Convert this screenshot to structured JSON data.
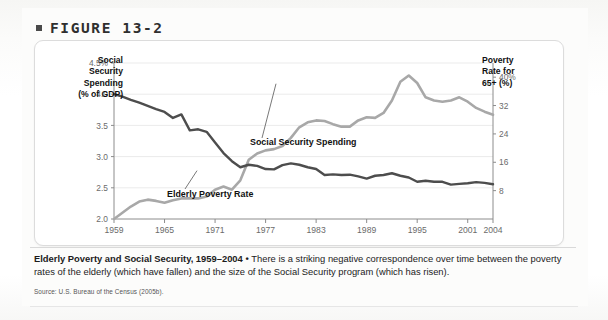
{
  "figure": {
    "bullet": "■",
    "label": "FIGURE 13-2"
  },
  "axis": {
    "left_title": "Social Security Spending (% of GDP)",
    "left_title_lines": [
      "Social",
      "Security",
      "Spending",
      "(% of GDP)"
    ],
    "right_title_lines": [
      "Poverty",
      "Rate for",
      "65+ (%)"
    ]
  },
  "caption": {
    "bold": "Elderly Poverty and Social Security, 1959–2004",
    "separator": " • ",
    "body": "There is a striking negative correspondence over time between the poverty rates of the elderly (which have fallen) and the size of the Social Security program (which has risen)."
  },
  "source": "Source: U.S. Bureau of the Census (2005b).",
  "colors": {
    "spending_line": "#a8a8a8",
    "poverty_line": "#4d4d4d",
    "grid": "#ebebeb",
    "axis": "#8c8c8c",
    "text": "#1b1b1b",
    "tick_text": "#6b6b6b",
    "card_bg": "#ffffff",
    "page_bg": "#fcfcfb"
  },
  "chart_data": {
    "type": "line",
    "xlabel": "",
    "grid": true,
    "legend": "inline-callout",
    "x_ticks": [
      1959,
      1965,
      1971,
      1977,
      1983,
      1989,
      1995,
      2001,
      2004
    ],
    "x_tick_labels": [
      "1959",
      "1965",
      "1971",
      "1977",
      "1983",
      "1989",
      "1995",
      "2001",
      "2004"
    ],
    "xlim": [
      1959,
      2004
    ],
    "left_axis": {
      "label": "Social Security Spending (% of GDP)",
      "ticks": [
        2.0,
        2.5,
        3.0,
        3.5,
        4.0,
        4.5
      ],
      "tick_labels": [
        "2.0",
        "2.5",
        "3.0",
        "3.5",
        "4.0",
        "4.5%"
      ],
      "ylim": [
        2.0,
        4.5
      ]
    },
    "right_axis": {
      "label": "Poverty Rate for 65+ (%)",
      "ticks": [
        8,
        16,
        24,
        32,
        40
      ],
      "tick_labels": [
        "8",
        "16",
        "24",
        "32",
        "40%"
      ],
      "ylim": [
        0,
        44
      ]
    },
    "series": [
      {
        "name": "Social Security Spending",
        "axis": "left",
        "color": "#a8a8a8",
        "label_text": "Social Security Spending",
        "x": [
          1959,
          1960,
          1961,
          1962,
          1963,
          1964,
          1965,
          1966,
          1967,
          1968,
          1969,
          1970,
          1971,
          1972,
          1973,
          1974,
          1975,
          1976,
          1977,
          1978,
          1979,
          1980,
          1981,
          1982,
          1983,
          1984,
          1985,
          1986,
          1987,
          1988,
          1989,
          1990,
          1991,
          1992,
          1993,
          1994,
          1995,
          1996,
          1997,
          1998,
          1999,
          2000,
          2001,
          2002,
          2003,
          2004
        ],
        "values": [
          2.0,
          2.1,
          2.2,
          2.28,
          2.31,
          2.29,
          2.26,
          2.3,
          2.33,
          2.33,
          2.33,
          2.36,
          2.47,
          2.52,
          2.47,
          2.62,
          2.95,
          3.05,
          3.1,
          3.12,
          3.17,
          3.3,
          3.47,
          3.55,
          3.58,
          3.57,
          3.52,
          3.48,
          3.48,
          3.58,
          3.63,
          3.62,
          3.7,
          3.9,
          4.2,
          4.3,
          4.18,
          3.95,
          3.9,
          3.88,
          3.9,
          3.95,
          3.88,
          3.78,
          3.72,
          3.67
        ]
      },
      {
        "name": "Elderly Poverty Rate",
        "axis": "right",
        "color": "#4d4d4d",
        "label_text": "Elderly Poverty Rate",
        "x": [
          1959,
          1960,
          1961,
          1962,
          1963,
          1964,
          1965,
          1966,
          1967,
          1968,
          1969,
          1970,
          1971,
          1972,
          1973,
          1974,
          1975,
          1976,
          1977,
          1978,
          1979,
          1980,
          1981,
          1982,
          1983,
          1984,
          1985,
          1986,
          1987,
          1988,
          1989,
          1990,
          1991,
          1992,
          1993,
          1994,
          1995,
          1996,
          1997,
          1998,
          1999,
          2000,
          2001,
          2002,
          2003,
          2004
        ],
        "values": [
          35.2,
          34.5,
          33.6,
          32.8,
          31.9,
          31.0,
          30.2,
          28.5,
          29.5,
          25.0,
          25.3,
          24.6,
          21.6,
          18.6,
          16.3,
          14.6,
          15.3,
          15.0,
          14.1,
          14.0,
          15.2,
          15.7,
          15.3,
          14.6,
          14.1,
          12.4,
          12.6,
          12.4,
          12.5,
          12.0,
          11.4,
          12.2,
          12.4,
          12.9,
          12.2,
          11.7,
          10.5,
          10.8,
          10.5,
          10.5,
          9.7,
          9.9,
          10.1,
          10.4,
          10.2,
          9.8
        ]
      }
    ],
    "annotations": [
      {
        "text": "Social Security Spending",
        "for": "Social Security Spending"
      },
      {
        "text": "Elderly Poverty Rate",
        "for": "Elderly Poverty Rate"
      }
    ]
  }
}
